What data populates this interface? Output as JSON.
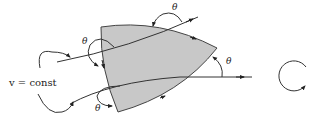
{
  "diagram": {
    "label_constant": "v = const",
    "theta_labels": [
      "θ",
      "θ",
      "θ",
      "θ"
    ],
    "region_fill": "#c8c8c8",
    "stroke_color": "#333333",
    "rotation_symbol": "counterclockwise-circle-arrow"
  }
}
